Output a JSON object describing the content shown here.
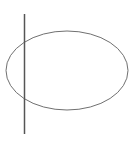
{
  "diagram": {
    "width": 136,
    "height": 148,
    "background": "#ffffff",
    "shapes": [
      {
        "type": "ellipse",
        "name": "ellipse",
        "cx": 67,
        "cy": 70.5,
        "rx": 61,
        "ry": 39.5,
        "stroke": "#707070",
        "stroke_width": 1,
        "fill": "none"
      },
      {
        "type": "line",
        "name": "vertical-line",
        "x1": 24.5,
        "y1": 14,
        "x2": 24.5,
        "y2": 134,
        "stroke": "#555555",
        "stroke_width": 1.5
      }
    ]
  }
}
